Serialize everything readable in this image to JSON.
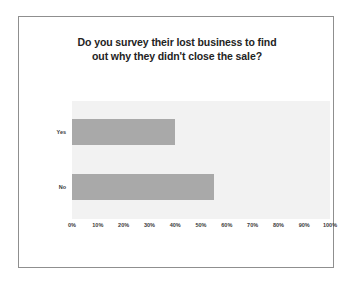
{
  "slide": {
    "background_color": "#ffffff",
    "frame_border_color": "#8f8f8f"
  },
  "chart_data": {
    "type": "bar",
    "orientation": "horizontal",
    "title": "Do you survey their lost business to find out why they didn't close the sale?",
    "title_lines": [
      "Do you survey their lost business to find",
      "out why they didn't close the sale?"
    ],
    "categories": [
      "Yes",
      "No"
    ],
    "values": [
      40,
      55
    ],
    "series": [
      {
        "name": "Percent of respondents",
        "values": [
          40,
          55
        ]
      }
    ],
    "xlabel": "",
    "ylabel": "",
    "xlim": [
      0,
      100
    ],
    "xticks": [
      0,
      10,
      20,
      30,
      40,
      50,
      60,
      70,
      80,
      90,
      100
    ],
    "xtick_labels": [
      "0%",
      "10%",
      "20%",
      "30%",
      "40%",
      "50%",
      "60%",
      "70%",
      "80%",
      "90%",
      "100%"
    ],
    "grid": false,
    "legend": false,
    "bar_color": "#a9a9a9",
    "plot_background_color": "#f2f2f2"
  }
}
